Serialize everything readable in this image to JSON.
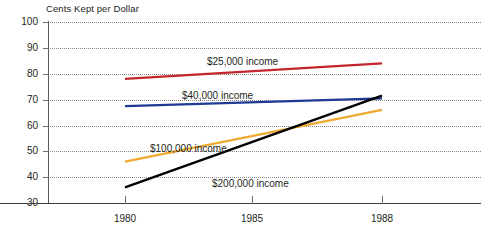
{
  "chart_data": {
    "type": "line",
    "title": "Cents Kept per Dollar",
    "xlabel": "",
    "ylabel": "Cents Kept per Dollar",
    "x": [
      1980,
      1988
    ],
    "xlim": [
      1980,
      1988
    ],
    "ylim": [
      30,
      100
    ],
    "xticks": [
      "1980",
      "1985",
      "1988"
    ],
    "xtick_values": [
      1980,
      1985,
      1988
    ],
    "yticks": [
      "100",
      "90",
      "80",
      "70",
      "60",
      "50",
      "40",
      "30"
    ],
    "ytick_values": [
      100,
      90,
      80,
      70,
      60,
      50,
      40,
      30
    ],
    "grid": true,
    "legend": "inline-labels",
    "series": [
      {
        "name": "$25,000 income",
        "color": "#c1272d",
        "values": [
          78,
          84
        ]
      },
      {
        "name": "$40,000 income",
        "color": "#1f3a93",
        "values": [
          67.5,
          70.5
        ]
      },
      {
        "name": "$100,000 income",
        "color": "#f0a830",
        "values": [
          46,
          66
        ]
      },
      {
        "name": "$200,000 income",
        "color": "#000000",
        "values": [
          36,
          71.5
        ]
      }
    ],
    "annotations": [
      {
        "text": "$25,000 income",
        "x": 1983.2,
        "y": 87.5
      },
      {
        "text": "$40,000 income",
        "x": 1982.5,
        "y": 75.5
      },
      {
        "text": "$100,000 income",
        "x": 1981.4,
        "y": 55.5
      },
      {
        "text": "$200,000 income",
        "x": 1983.6,
        "y": 42.5
      }
    ]
  }
}
